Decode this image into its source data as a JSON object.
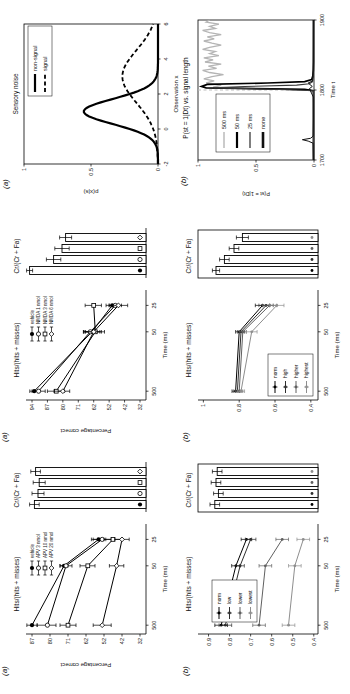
{
  "page": {
    "background": "#ffffff"
  },
  "figure_labels": {
    "a": "(a)",
    "b": "(b)"
  },
  "chart_data": [
    {
      "panel": "left-a-line",
      "type": "line",
      "title": "Hits/(hits + misses)",
      "ylabel": "Percentage correct",
      "xlabel": "Time (ms)",
      "x_categories": [
        "500",
        "50",
        "25"
      ],
      "x_fractions": [
        0.08,
        0.62,
        0.86
      ],
      "y_scale": {
        "type": "ticks",
        "labels": [
          87,
          80,
          71,
          62,
          52,
          42,
          32
        ]
      },
      "series": [
        {
          "name": "vehicle",
          "marker": "circle-filled",
          "color": "#000000",
          "values": [
            87,
            73,
            55
          ],
          "errors": [
            2,
            2,
            4
          ]
        },
        {
          "name": "APV 3 nmol",
          "marker": "circle-open",
          "color": "#000000",
          "values": [
            81,
            72,
            53
          ],
          "errors": [
            4,
            3,
            5
          ]
        },
        {
          "name": "APV 10 nmol",
          "marker": "square-open",
          "color": "#000000",
          "values": [
            71,
            61,
            47
          ],
          "errors": [
            4,
            4,
            5
          ]
        },
        {
          "name": "APV 20 nmol",
          "marker": "diamond-open",
          "color": "#000000",
          "values": [
            53,
            45,
            42
          ],
          "errors": [
            5,
            4,
            4
          ]
        }
      ],
      "legend": {
        "boxed": false,
        "position": "top-right"
      }
    },
    {
      "panel": "left-a-bars",
      "type": "bar",
      "title": "Cr/(Cr + Fa)",
      "values": [
        0.93,
        0.9,
        0.89,
        0.92
      ],
      "errors": [
        0.04,
        0.05,
        0.05,
        0.04
      ],
      "markers": [
        "circle-filled",
        "circle-open",
        "square-open",
        "diamond-open"
      ],
      "marker_colors": [
        "#000000",
        "#000000",
        "#000000",
        "#000000"
      ],
      "framed": false
    },
    {
      "panel": "left-b-line",
      "type": "line",
      "title": "Hits/(hits + misses)",
      "ylabel": "",
      "xlabel": "Time (ms)",
      "x_categories": [
        "500",
        "50",
        "25"
      ],
      "x_fractions": [
        0.08,
        0.62,
        0.86
      ],
      "y_scale": {
        "type": "linear",
        "min": 0.38,
        "max": 0.95,
        "ticks": [
          0.9,
          0.8,
          0.7,
          0.6,
          0.5,
          0.4
        ]
      },
      "series": [
        {
          "name": "norm",
          "marker": "dot",
          "color": "#000000",
          "values": [
            0.84,
            0.77,
            0.72
          ],
          "errors": [
            0.03,
            0.02,
            0.025
          ]
        },
        {
          "name": "low",
          "marker": "dot",
          "color": "#2e2e2e",
          "values": [
            0.82,
            0.75,
            0.7
          ],
          "errors": [
            0.03,
            0.02,
            0.025
          ]
        },
        {
          "name": "lower",
          "marker": "dot",
          "color": "#606060",
          "values": [
            0.66,
            0.63,
            0.55
          ],
          "errors": [
            0.03,
            0.03,
            0.03
          ]
        },
        {
          "name": "lowest",
          "marker": "dot",
          "color": "#8e8e8e",
          "values": [
            0.52,
            0.49,
            0.45
          ],
          "errors": [
            0.03,
            0.03,
            0.03
          ]
        }
      ],
      "legend": {
        "boxed": true,
        "position": "top-left"
      }
    },
    {
      "panel": "left-b-bars",
      "type": "bar",
      "title": "Cr/(Cr + Fa)",
      "values": [
        0.86,
        0.83,
        0.85,
        0.84
      ],
      "errors": [
        0.04,
        0.04,
        0.04,
        0.04
      ],
      "markers": [
        "dot",
        "dot",
        "dot",
        "dot"
      ],
      "marker_colors": [
        "#000000",
        "#2e2e2e",
        "#606060",
        "#8e8e8e"
      ],
      "framed": true
    },
    {
      "panel": "middle-a-line",
      "type": "line",
      "title": "Hits/(hits + misses)",
      "ylabel": "Percentage correct",
      "xlabel": "Time (ms)",
      "x_categories": [
        "500",
        "50",
        "25"
      ],
      "x_fractions": [
        0.08,
        0.62,
        0.86
      ],
      "y_scale": {
        "type": "ticks",
        "labels": [
          94,
          87,
          80,
          71,
          62,
          52,
          42,
          32
        ]
      },
      "series": [
        {
          "name": "vehicle",
          "marker": "circle-filled",
          "color": "#000000",
          "values": [
            93,
            63,
            50
          ],
          "errors": [
            2,
            5,
            4
          ]
        },
        {
          "name": "NMDA 1 nmol",
          "marker": "circle-open",
          "color": "#000000",
          "values": [
            91,
            64,
            48
          ],
          "errors": [
            3,
            4,
            4
          ]
        },
        {
          "name": "NMDA 3 nmol",
          "marker": "square-open",
          "color": "#000000",
          "values": [
            83,
            61,
            62
          ],
          "errors": [
            4,
            6,
            5
          ]
        },
        {
          "name": "NMDA 6 nmol",
          "marker": "diamond-open",
          "color": "#000000",
          "values": [
            80,
            62,
            46
          ],
          "errors": [
            4,
            5,
            6
          ]
        }
      ],
      "legend": {
        "boxed": false,
        "position": "top-right"
      }
    },
    {
      "panel": "middle-a-bars",
      "type": "bar",
      "title": "Cr/(Cr + Fa)",
      "values": [
        0.97,
        0.77,
        0.7,
        0.67
      ],
      "errors": [
        0.025,
        0.06,
        0.06,
        0.05
      ],
      "markers": [
        "circle-filled",
        "circle-open",
        "square-open",
        "diamond-open"
      ],
      "marker_colors": [
        "#000000",
        "#000000",
        "#000000",
        "#000000"
      ],
      "framed": false
    },
    {
      "panel": "middle-b-line",
      "type": "line",
      "title": "Hits/(hits + misses)",
      "ylabel": "",
      "xlabel": "Time (ms)",
      "x_categories": [
        "500",
        "50",
        "25"
      ],
      "x_fractions": [
        0.08,
        0.62,
        0.86
      ],
      "y_scale": {
        "type": "linear",
        "min": 0.36,
        "max": 1.03,
        "ticks": [
          1,
          0.8,
          0.6,
          0.4
        ]
      },
      "series": [
        {
          "name": "norm",
          "marker": "dot",
          "color": "#000000",
          "values": [
            0.82,
            0.8,
            0.67
          ],
          "errors": [
            0.02,
            0.02,
            0.04
          ]
        },
        {
          "name": "high",
          "marker": "dot",
          "color": "#2e2e2e",
          "values": [
            0.81,
            0.79,
            0.65
          ],
          "errors": [
            0.02,
            0.02,
            0.04
          ]
        },
        {
          "name": "higher",
          "marker": "dot",
          "color": "#606060",
          "values": [
            0.8,
            0.78,
            0.63
          ],
          "errors": [
            0.02,
            0.02,
            0.04
          ]
        },
        {
          "name": "highest",
          "marker": "dot",
          "color": "#8e8e8e",
          "values": [
            0.79,
            0.73,
            0.59
          ],
          "errors": [
            0.02,
            0.03,
            0.04
          ]
        }
      ],
      "legend": {
        "boxed": true,
        "position": "bottom-left"
      }
    },
    {
      "panel": "middle-b-bars",
      "type": "bar",
      "title": "Cr/(Cr + Fa)",
      "values": [
        0.85,
        0.78,
        0.7,
        0.63
      ],
      "errors": [
        0.03,
        0.04,
        0.04,
        0.05
      ],
      "markers": [
        "dot",
        "dot",
        "dot",
        "dot"
      ],
      "marker_colors": [
        "#000000",
        "#2e2e2e",
        "#606060",
        "#8e8e8e"
      ],
      "framed": true
    },
    {
      "panel": "right-a-sensory-noise",
      "type": "gauss",
      "title": "Sensory noise",
      "ylabel": "p(x|s)",
      "xlabel": "Observation x",
      "x_domain": [
        -2,
        6
      ],
      "x_ticks": [
        -2,
        0,
        2,
        4,
        6
      ],
      "y_ticks": [
        0,
        0.5,
        1
      ],
      "y_lim": [
        0,
        1
      ],
      "curves": [
        {
          "name": "non-signal",
          "mean": 1,
          "sd": 0.72,
          "line": "solid",
          "width": 2.2,
          "color": "#000000"
        },
        {
          "name": "signal",
          "mean": 3,
          "sd": 1.5,
          "line": "dashed",
          "width": 1.8,
          "color": "#000000"
        }
      ],
      "legend": {
        "boxed": true,
        "position": "top-right"
      }
    },
    {
      "panel": "right-b-belief",
      "type": "belief",
      "title": "P(st = 1|Dt) vs. signal length",
      "ylabel": "P(st = 1|Dt)",
      "xlabel": "Time t",
      "x_domain": [
        1700,
        1900
      ],
      "x_ticks": [
        1700,
        1800,
        1900
      ],
      "y_ticks": [
        0,
        0.5,
        1
      ],
      "onset": {
        "t": 1800,
        "color": "#bdbdbd"
      },
      "traces": [
        {
          "name": "500 ms",
          "color": "#b5b5b5",
          "width": 1.3,
          "legend_width": 1.4,
          "points": [
            [
              1700,
              0.005
            ],
            [
              1720,
              0.006
            ],
            [
              1740,
              0.005
            ],
            [
              1760,
              0.006
            ],
            [
              1780,
              0.005
            ],
            [
              1796,
              0.006
            ],
            [
              1800,
              0.03
            ],
            [
              1802,
              0.5
            ],
            [
              1804,
              0.87
            ],
            [
              1807,
              0.8
            ],
            [
              1810,
              0.93
            ],
            [
              1813,
              0.86
            ],
            [
              1816,
              0.95
            ],
            [
              1819,
              0.88
            ],
            [
              1822,
              0.78
            ],
            [
              1825,
              0.9
            ],
            [
              1828,
              0.96
            ],
            [
              1831,
              0.84
            ],
            [
              1834,
              0.91
            ],
            [
              1837,
              0.8
            ],
            [
              1840,
              0.94
            ],
            [
              1843,
              0.87
            ],
            [
              1846,
              0.95
            ],
            [
              1849,
              0.82
            ],
            [
              1852,
              0.9
            ],
            [
              1855,
              0.85
            ],
            [
              1858,
              0.96
            ],
            [
              1861,
              0.9
            ],
            [
              1864,
              0.8
            ],
            [
              1867,
              0.88
            ],
            [
              1870,
              0.95
            ],
            [
              1873,
              0.86
            ],
            [
              1876,
              0.92
            ],
            [
              1879,
              0.8
            ],
            [
              1882,
              0.9
            ],
            [
              1885,
              0.96
            ],
            [
              1888,
              0.85
            ],
            [
              1891,
              0.9
            ],
            [
              1894,
              0.82
            ],
            [
              1897,
              0.93
            ],
            [
              1900,
              0.9
            ]
          ]
        },
        {
          "name": "50 ms",
          "color": "#000000",
          "width": 1.7,
          "legend_width": 2.2,
          "points": [
            [
              1700,
              0.004
            ],
            [
              1780,
              0.004
            ],
            [
              1799,
              0.004
            ],
            [
              1801,
              0.08
            ],
            [
              1803,
              0.93
            ],
            [
              1805,
              0.97
            ],
            [
              1808,
              0.92
            ],
            [
              1810,
              0.4
            ],
            [
              1812,
              0.08
            ],
            [
              1815,
              0.02
            ],
            [
              1820,
              0.01
            ],
            [
              1828,
              0.006
            ],
            [
              1840,
              0.004
            ],
            [
              1900,
              0.004
            ]
          ]
        },
        {
          "name": "25 ms",
          "color": "#3a3a3a",
          "width": 1.1,
          "legend_width": 1.3,
          "points": [
            [
              1700,
              0.004
            ],
            [
              1799,
              0.004
            ],
            [
              1801,
              0.35
            ],
            [
              1803,
              0.86
            ],
            [
              1805,
              0.6
            ],
            [
              1807,
              0.15
            ],
            [
              1809,
              0.04
            ],
            [
              1812,
              0.012
            ],
            [
              1820,
              0.006
            ],
            [
              1900,
              0.004
            ]
          ]
        },
        {
          "name": "none",
          "color": "#111111",
          "width": 1.0,
          "legend_width": 2.6,
          "points": [
            [
              1700,
              0.005
            ],
            [
              1724,
              0.008
            ],
            [
              1727,
              0.05
            ],
            [
              1729,
              0.1
            ],
            [
              1731,
              0.03
            ],
            [
              1734,
              0.008
            ],
            [
              1760,
              0.005
            ],
            [
              1790,
              0.006
            ],
            [
              1802,
              0.04
            ],
            [
              1805,
              0.015
            ],
            [
              1810,
              0.05
            ],
            [
              1813,
              0.012
            ],
            [
              1830,
              0.006
            ],
            [
              1860,
              0.005
            ],
            [
              1900,
              0.005
            ]
          ]
        }
      ],
      "legend": {
        "boxed": true,
        "position": "top-left"
      }
    }
  ]
}
